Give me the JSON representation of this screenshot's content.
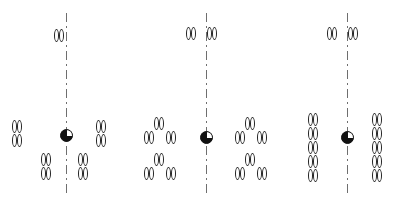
{
  "figure": {
    "width": 397,
    "height": 210,
    "background_color": "#ffffff",
    "glyph_outline_color": "#222222",
    "axis_color": "#6e6e6e",
    "centriole_color": "#111111"
  },
  "panels": [
    {
      "id": "panel-1",
      "label": "",
      "axis": {
        "x": 66,
        "top": 13,
        "bottom": 196,
        "style": "dash-dot"
      },
      "centriole": {
        "x": 60,
        "y": 129,
        "size": 13,
        "shading": "three-quarter-filled"
      },
      "groups": [
        {
          "name": "top-axis-pair",
          "position": "top",
          "pairs": [
            {
              "x": 54,
              "y": 29
            }
          ]
        },
        {
          "name": "left-column",
          "position": "left",
          "pairs": [
            {
              "x": 12,
              "y": 120
            },
            {
              "x": 12,
              "y": 134
            }
          ]
        },
        {
          "name": "right-column",
          "position": "right",
          "pairs": [
            {
              "x": 96,
              "y": 120
            },
            {
              "x": 96,
              "y": 134
            }
          ]
        },
        {
          "name": "bottom-left-cluster",
          "position": "bottom-left",
          "pairs": [
            {
              "x": 41,
              "y": 153
            },
            {
              "x": 41,
              "y": 167
            }
          ]
        },
        {
          "name": "bottom-right-cluster",
          "position": "bottom-right",
          "pairs": [
            {
              "x": 78,
              "y": 153
            },
            {
              "x": 78,
              "y": 167
            }
          ]
        }
      ]
    },
    {
      "id": "panel-2",
      "label": "",
      "axis": {
        "x": 206,
        "top": 13,
        "bottom": 196,
        "style": "dash-dot"
      },
      "centriole": {
        "x": 200,
        "y": 131,
        "size": 13,
        "shading": "three-quarter-filled"
      },
      "groups": [
        {
          "name": "top-axis-pairs",
          "position": "top",
          "pairs": [
            {
              "x": 186,
              "y": 27
            },
            {
              "x": 207,
              "y": 27
            }
          ]
        },
        {
          "name": "left-upper-triad",
          "position": "left-upper",
          "pairs": [
            {
              "x": 154,
              "y": 117
            },
            {
              "x": 144,
              "y": 131
            },
            {
              "x": 166,
              "y": 131
            }
          ]
        },
        {
          "name": "left-lower-triad",
          "position": "left-lower",
          "pairs": [
            {
              "x": 154,
              "y": 153
            },
            {
              "x": 144,
              "y": 167
            },
            {
              "x": 166,
              "y": 167
            }
          ]
        },
        {
          "name": "right-upper-triad",
          "position": "right-upper",
          "pairs": [
            {
              "x": 245,
              "y": 117
            },
            {
              "x": 235,
              "y": 131
            },
            {
              "x": 257,
              "y": 131
            }
          ]
        },
        {
          "name": "right-lower-triad",
          "position": "right-lower",
          "pairs": [
            {
              "x": 245,
              "y": 153
            },
            {
              "x": 235,
              "y": 167
            },
            {
              "x": 257,
              "y": 167
            }
          ]
        }
      ]
    },
    {
      "id": "panel-3",
      "label": "",
      "axis": {
        "x": 347,
        "top": 13,
        "bottom": 196,
        "style": "dash-dot"
      },
      "centriole": {
        "x": 341,
        "y": 131,
        "size": 13,
        "shading": "three-quarter-filled"
      },
      "groups": [
        {
          "name": "top-axis-pairs",
          "position": "top",
          "pairs": [
            {
              "x": 327,
              "y": 27
            },
            {
              "x": 348,
              "y": 27
            }
          ]
        },
        {
          "name": "left-column",
          "position": "left",
          "pairs": [
            {
              "x": 308,
              "y": 113
            },
            {
              "x": 308,
              "y": 127
            },
            {
              "x": 308,
              "y": 141
            },
            {
              "x": 308,
              "y": 155
            },
            {
              "x": 308,
              "y": 169
            }
          ]
        },
        {
          "name": "right-column",
          "position": "right",
          "pairs": [
            {
              "x": 372,
              "y": 113
            },
            {
              "x": 372,
              "y": 127
            },
            {
              "x": 372,
              "y": 141
            },
            {
              "x": 372,
              "y": 155
            },
            {
              "x": 372,
              "y": 169
            }
          ]
        }
      ]
    }
  ]
}
